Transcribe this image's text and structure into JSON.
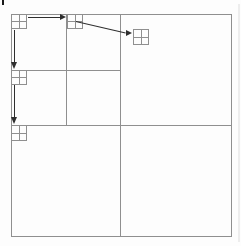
{
  "figure": {
    "width": 241,
    "height": 246
  },
  "colors": {
    "bg": "#fdfdfd",
    "line": "#8f8f8f",
    "arrow": "#2e2e2e",
    "mark": "#1a1a1a",
    "edge_shade": "#ededed"
  },
  "diagram": {
    "width": 241,
    "height": 246,
    "elements": [
      {
        "name": "figure-crop-mark",
        "type": "tick",
        "x": 2,
        "y": 0,
        "w": 2,
        "h": 5,
        "color": "mark"
      },
      {
        "name": "page-edge-shade",
        "type": "tick",
        "x": 238,
        "y": 4,
        "w": 2,
        "h": 238,
        "color": "edge_shade"
      },
      {
        "name": "outer-square",
        "type": "box",
        "x": 11,
        "y": 14,
        "w": 221,
        "h": 223
      },
      {
        "name": "main-vertical-divider",
        "type": "vline",
        "x": 120,
        "y": 14,
        "h": 223
      },
      {
        "name": "main-horizontal-divider",
        "type": "hline",
        "x": 11,
        "y": 125,
        "w": 221
      },
      {
        "name": "subquad-vertical-divider",
        "type": "vline",
        "x": 66,
        "y": 14,
        "h": 111
      },
      {
        "name": "subquad-horizontal-divider",
        "type": "hline",
        "x": 11,
        "y": 70,
        "w": 109
      },
      {
        "name": "node-grid-root",
        "type": "minigrid",
        "x": 11,
        "y": 14,
        "w": 16,
        "h": 15
      },
      {
        "name": "node-grid-ne-subquadrant",
        "type": "minigrid",
        "x": 67,
        "y": 14,
        "w": 16,
        "h": 15
      },
      {
        "name": "node-grid-ne-quadrant",
        "type": "minigrid",
        "x": 133,
        "y": 29,
        "w": 16,
        "h": 16
      },
      {
        "name": "node-grid-sw-subquadrant",
        "type": "minigrid",
        "x": 11,
        "y": 70,
        "w": 16,
        "h": 15
      },
      {
        "name": "node-grid-sw-quadrant",
        "type": "minigrid",
        "x": 11,
        "y": 125,
        "w": 16,
        "h": 16
      },
      {
        "name": "arrow-root-to-ne-subquad-shaft",
        "type": "hline",
        "x": 28,
        "y": 17,
        "w": 32,
        "color": "arrow"
      },
      {
        "name": "arrow-root-to-ne-subquad-head",
        "type": "head_right",
        "x": 66,
        "y": 17,
        "color": "arrow"
      },
      {
        "name": "arrow-ne-subquad-to-quad-shaft",
        "type": "rotline",
        "x": 76,
        "y": 21,
        "len": 51,
        "angle": 13,
        "color": "arrow"
      },
      {
        "name": "arrow-ne-subquad-to-quad-head",
        "type": "head_right",
        "x": 132,
        "y": 33,
        "color": "arrow"
      },
      {
        "name": "arrow-root-to-sw-subquad-shaft",
        "type": "vline",
        "x": 14,
        "y": 30,
        "h": 33,
        "color": "arrow"
      },
      {
        "name": "arrow-root-to-sw-subquad-head",
        "type": "head_down",
        "x": 14,
        "y": 69,
        "color": "arrow"
      },
      {
        "name": "arrow-sw-subquad-to-quad-shaft",
        "type": "vline",
        "x": 14,
        "y": 85,
        "h": 33,
        "color": "arrow"
      },
      {
        "name": "arrow-sw-subquad-to-quad-head",
        "type": "head_down",
        "x": 14,
        "y": 124,
        "color": "arrow"
      }
    ]
  }
}
